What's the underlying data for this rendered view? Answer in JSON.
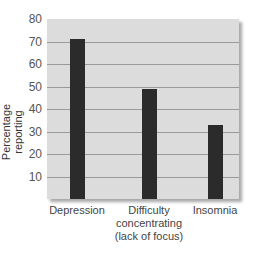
{
  "chart_data": {
    "type": "bar",
    "title": "",
    "xlabel": "",
    "ylabel": "Percentage reporting",
    "categories": [
      "Depression",
      "Difficulty concentrating (lack of focus)",
      "Insomnia"
    ],
    "category_lines": [
      [
        "Depression"
      ],
      [
        "Difficulty",
        "concentrating",
        "(lack of focus)"
      ],
      [
        "Insomnia"
      ]
    ],
    "values": [
      71,
      49,
      33
    ],
    "ylim": [
      0,
      80
    ],
    "yticks": [
      10,
      20,
      30,
      40,
      50,
      60,
      70,
      80
    ],
    "grid": true,
    "bar_color": "#2b2b2b",
    "background_color": "#dcdcdc"
  }
}
